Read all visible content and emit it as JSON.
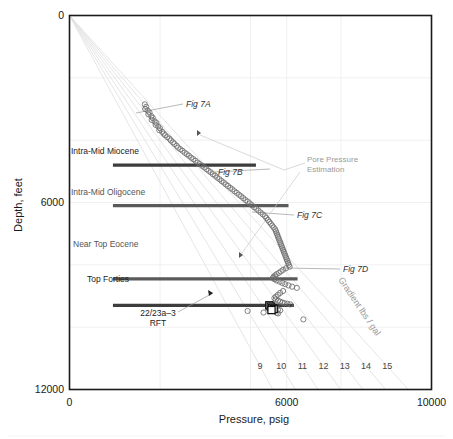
{
  "chart_data": {
    "type": "scatter",
    "title": "",
    "xlabel": "Pressure,  psig",
    "ylabel": "Depth,  feet",
    "xlim": [
      0,
      10000
    ],
    "ylim": [
      0,
      12000
    ],
    "y_inverted": true,
    "grid": true,
    "xticks": [
      0,
      6000,
      10000
    ],
    "xticklabels": [
      "0",
      "6000",
      "10000"
    ],
    "yticks": [
      0,
      6000,
      12000
    ],
    "yticklabels": [
      "0",
      "6000",
      "12000"
    ],
    "x_minor_gridlines": [
      2500,
      5000,
      7500
    ],
    "y_minor_gridlines": [
      2000,
      4000,
      8000,
      10000
    ],
    "legend_position": "none",
    "gradient_lines": {
      "title": "Gradient lbs / gal",
      "units": "lbs/gal",
      "labels": [
        "9",
        "10",
        "11",
        "12",
        "13",
        "14",
        "15"
      ],
      "values": [
        9,
        10,
        11,
        12,
        13,
        14,
        15
      ],
      "psi_per_ft_per_ppg": 0.052,
      "origin": [
        0,
        0
      ]
    },
    "series": [
      {
        "name": "pore-pressure-main-trend",
        "marker": "open-circle",
        "points": [
          [
            2080,
            2850
          ],
          [
            2120,
            2930
          ],
          [
            2090,
            3000
          ],
          [
            2160,
            3050
          ],
          [
            2210,
            3110
          ],
          [
            2180,
            3170
          ],
          [
            2260,
            3230
          ],
          [
            2300,
            3290
          ],
          [
            2270,
            3350
          ],
          [
            2350,
            3400
          ],
          [
            2400,
            3450
          ],
          [
            2380,
            3510
          ],
          [
            2450,
            3560
          ],
          [
            2500,
            3620
          ],
          [
            2480,
            3680
          ],
          [
            2560,
            3730
          ],
          [
            2600,
            3790
          ],
          [
            2640,
            3840
          ],
          [
            2700,
            3900
          ],
          [
            2760,
            3950
          ],
          [
            2800,
            4010
          ],
          [
            2860,
            4070
          ],
          [
            2900,
            4120
          ],
          [
            2960,
            4180
          ],
          [
            3000,
            4240
          ],
          [
            3060,
            4290
          ],
          [
            3120,
            4340
          ],
          [
            3180,
            4400
          ],
          [
            3240,
            4450
          ],
          [
            3300,
            4500
          ],
          [
            3360,
            4560
          ],
          [
            3420,
            4610
          ],
          [
            3480,
            4660
          ],
          [
            3540,
            4720
          ],
          [
            3600,
            4770
          ],
          [
            3660,
            4820
          ],
          [
            3720,
            4870
          ],
          [
            3780,
            4930
          ],
          [
            3840,
            4980
          ],
          [
            3900,
            5030
          ],
          [
            3960,
            5090
          ],
          [
            4020,
            5140
          ],
          [
            4080,
            5200
          ],
          [
            4140,
            5250
          ],
          [
            4200,
            5310
          ],
          [
            4260,
            5360
          ],
          [
            4320,
            5420
          ],
          [
            4380,
            5470
          ],
          [
            4440,
            5530
          ],
          [
            4500,
            5580
          ],
          [
            4560,
            5640
          ],
          [
            4620,
            5690
          ],
          [
            4680,
            5750
          ],
          [
            4740,
            5800
          ],
          [
            4800,
            5860
          ],
          [
            4860,
            5920
          ],
          [
            4920,
            5970
          ],
          [
            4980,
            6030
          ],
          [
            5040,
            6090
          ],
          [
            5100,
            6150
          ],
          [
            5160,
            6200
          ],
          [
            5220,
            6260
          ],
          [
            5280,
            6320
          ],
          [
            5340,
            6380
          ],
          [
            5400,
            6440
          ],
          [
            5440,
            6500
          ],
          [
            5480,
            6560
          ],
          [
            5520,
            6620
          ],
          [
            5560,
            6680
          ],
          [
            5600,
            6740
          ],
          [
            5640,
            6800
          ],
          [
            5680,
            6860
          ],
          [
            5700,
            6920
          ],
          [
            5720,
            6980
          ],
          [
            5740,
            7040
          ],
          [
            5760,
            7100
          ],
          [
            5780,
            7160
          ],
          [
            5800,
            7220
          ],
          [
            5820,
            7280
          ],
          [
            5840,
            7340
          ],
          [
            5860,
            7400
          ],
          [
            5880,
            7460
          ],
          [
            5900,
            7520
          ],
          [
            5920,
            7580
          ],
          [
            5940,
            7640
          ],
          [
            5960,
            7700
          ],
          [
            5980,
            7760
          ],
          [
            6000,
            7820
          ],
          [
            6020,
            7880
          ],
          [
            6040,
            7940
          ],
          [
            6060,
            8000
          ],
          [
            6080,
            8060
          ],
          [
            5980,
            8110
          ],
          [
            5900,
            8160
          ],
          [
            5840,
            8210
          ],
          [
            5780,
            8260
          ],
          [
            5720,
            8300
          ],
          [
            5680,
            8340
          ],
          [
            5640,
            8380
          ],
          [
            5620,
            8420
          ],
          [
            5660,
            8460
          ],
          [
            5720,
            8500
          ],
          [
            5800,
            8540
          ],
          [
            5880,
            8580
          ],
          [
            5960,
            8620
          ],
          [
            6050,
            8660
          ],
          [
            6150,
            8700
          ],
          [
            6280,
            8740
          ],
          [
            5900,
            8840
          ],
          [
            5820,
            8900
          ],
          [
            5760,
            8960
          ],
          [
            5700,
            9020
          ],
          [
            5660,
            9070
          ],
          [
            5700,
            9110
          ],
          [
            5760,
            9150
          ],
          [
            5820,
            9180
          ],
          [
            5880,
            9210
          ],
          [
            5940,
            9230
          ],
          [
            6020,
            9250
          ],
          [
            6100,
            9270
          ],
          [
            5560,
            9340
          ],
          [
            5700,
            9380
          ],
          [
            5620,
            9420
          ],
          [
            5760,
            9440
          ],
          [
            5820,
            9460
          ],
          [
            4920,
            9480
          ],
          [
            5360,
            9530
          ],
          [
            5720,
            9540
          ],
          [
            5760,
            9560
          ],
          [
            6460,
            9750
          ]
        ]
      },
      {
        "name": "22-23a-3-rft-measured",
        "marker": "open-square",
        "points": [
          [
            5520,
            9300
          ],
          [
            5560,
            9340
          ],
          [
            5600,
            9380
          ],
          [
            5640,
            9420
          ],
          [
            5580,
            9450
          ]
        ]
      }
    ],
    "horizons": [
      {
        "label": "Intra-Mid Miocene",
        "depth": 4800,
        "x_start": 1200,
        "x_end": 5150,
        "style": "dark"
      },
      {
        "label": "Intra-Mid Oligocene",
        "depth": 6100,
        "x_start": 1200,
        "x_end": 6050,
        "style": "light"
      },
      {
        "label": "Near Top Eocene",
        "depth": 8450,
        "x_start": 1200,
        "x_end": 6300,
        "style": "light"
      },
      {
        "label": "Top Forties",
        "depth": 9300,
        "x_start": 1200,
        "x_end": 6200,
        "style": "dark"
      }
    ],
    "annotations": [
      {
        "label": "Fig 7A",
        "type": "figure-callout",
        "target": [
          2080,
          2850
        ]
      },
      {
        "label": "Fig 7B",
        "type": "figure-callout",
        "target": [
          4520,
          5160
        ]
      },
      {
        "label": "Fig 7C",
        "type": "figure-callout",
        "target": [
          6120,
          7260
        ]
      },
      {
        "label": "Fig 7D",
        "type": "figure-callout",
        "target": [
          6300,
          8760
        ]
      },
      {
        "label": "Pore Pressure Estimation",
        "lines": [
          "Pore Pressure",
          "Estimation"
        ],
        "type": "group-callout"
      },
      {
        "label": "22/23a-3 RFT",
        "lines": [
          "22/23a–3",
          "RFT"
        ],
        "type": "data-callout"
      }
    ]
  },
  "figure": {
    "x_axis_label": "Pressure,  psig",
    "y_axis_label": "Depth,  feet",
    "x_ticks": [
      "0",
      "6000",
      "10000"
    ],
    "y_ticks": [
      "0",
      "6000",
      "12000"
    ],
    "gradient_numbers": [
      "9",
      "10",
      "11",
      "12",
      "13",
      "14",
      "15"
    ],
    "gradient_title": "Gradient lbs / gal",
    "fig_a": "Fig 7A",
    "fig_b": "Fig 7B",
    "fig_c": "Fig 7C",
    "fig_d": "Fig 7D",
    "pore_line1": "Pore Pressure",
    "pore_line2": "Estimation",
    "rft_line1": "22/23a–3",
    "rft_line2": "RFT",
    "horizon_miocene": "Intra-Mid Miocene",
    "horizon_oligocene": "Intra-Mid Oligocene",
    "horizon_eocene": "Near Top Eocene",
    "horizon_forties": "Top Forties"
  },
  "colors": {
    "frame": "#1a1a1a",
    "grid": "#ececec",
    "gradient_line": "#e2e2e2",
    "marker_stroke": "#6d6d6d",
    "square_stroke": "#111111",
    "horizon_dark": "#3d3d3d",
    "horizon_light": "#5a5a5a",
    "annotation_gray": "#9a9a9a"
  }
}
